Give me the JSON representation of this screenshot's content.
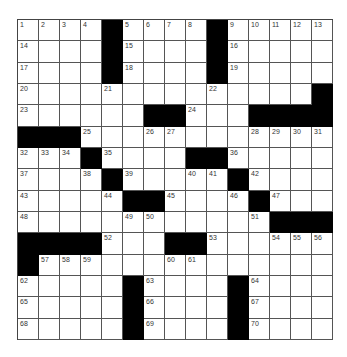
{
  "puzzle": {
    "rows": 15,
    "cols": 15,
    "grid": [
      [
        "1",
        "2",
        "3",
        "4",
        "#",
        "5",
        "6",
        "7",
        "8",
        "#",
        "9",
        "10",
        "11",
        "12",
        "13"
      ],
      [
        "14",
        "",
        "",
        "",
        "#",
        "15",
        "",
        "",
        "",
        "#",
        "16",
        "",
        "",
        "",
        ""
      ],
      [
        "17",
        "",
        "",
        "",
        "#",
        "18",
        "",
        "",
        "",
        "#",
        "19",
        "",
        "",
        "",
        ""
      ],
      [
        "20",
        "",
        "",
        "",
        "21",
        "",
        "",
        "",
        "",
        "22",
        "",
        "",
        "",
        "",
        "#"
      ],
      [
        "23",
        "",
        "",
        "",
        "",
        "",
        "#",
        "#",
        "24",
        "",
        "",
        "#",
        "#",
        "#",
        "#"
      ],
      [
        "#",
        "#",
        "#",
        "25",
        "",
        "",
        "26",
        "27",
        "",
        "",
        "",
        "28",
        "29",
        "30",
        "31"
      ],
      [
        "32",
        "33",
        "34",
        "#",
        "35",
        "",
        "",
        "",
        "#",
        "#",
        "36",
        "",
        "",
        "",
        ""
      ],
      [
        "37",
        "",
        "",
        "38",
        "#",
        "39",
        "",
        "",
        "40",
        "41",
        "#",
        "42",
        "",
        "",
        ""
      ],
      [
        "43",
        "",
        "",
        "",
        "44",
        "#",
        "#",
        "45",
        "",
        "",
        "46",
        "#",
        "47",
        "",
        ""
      ],
      [
        "48",
        "",
        "",
        "",
        "",
        "49",
        "50",
        "",
        "",
        "",
        "",
        "51",
        "#",
        "#",
        "#"
      ],
      [
        "#",
        "#",
        "#",
        "#",
        "52",
        "",
        "",
        "#",
        "#",
        "53",
        "",
        "",
        "54",
        "55",
        "56"
      ],
      [
        "#",
        "57",
        "58",
        "59",
        "",
        "",
        "",
        "60",
        "61",
        "",
        "",
        "",
        "",
        "",
        ""
      ],
      [
        "62",
        "",
        "",
        "",
        "",
        "#",
        "63",
        "",
        "",
        "",
        "#",
        "64",
        "",
        "",
        ""
      ],
      [
        "65",
        "",
        "",
        "",
        "",
        "#",
        "66",
        "",
        "",
        "",
        "#",
        "67",
        "",
        "",
        ""
      ],
      [
        "68",
        "",
        "",
        "",
        "",
        "#",
        "69",
        "",
        "",
        "",
        "#",
        "70",
        "",
        "",
        ""
      ]
    ]
  },
  "colors": {
    "block": "#000000",
    "cell": "#ffffff",
    "line": "#555555",
    "number": "#333333"
  }
}
